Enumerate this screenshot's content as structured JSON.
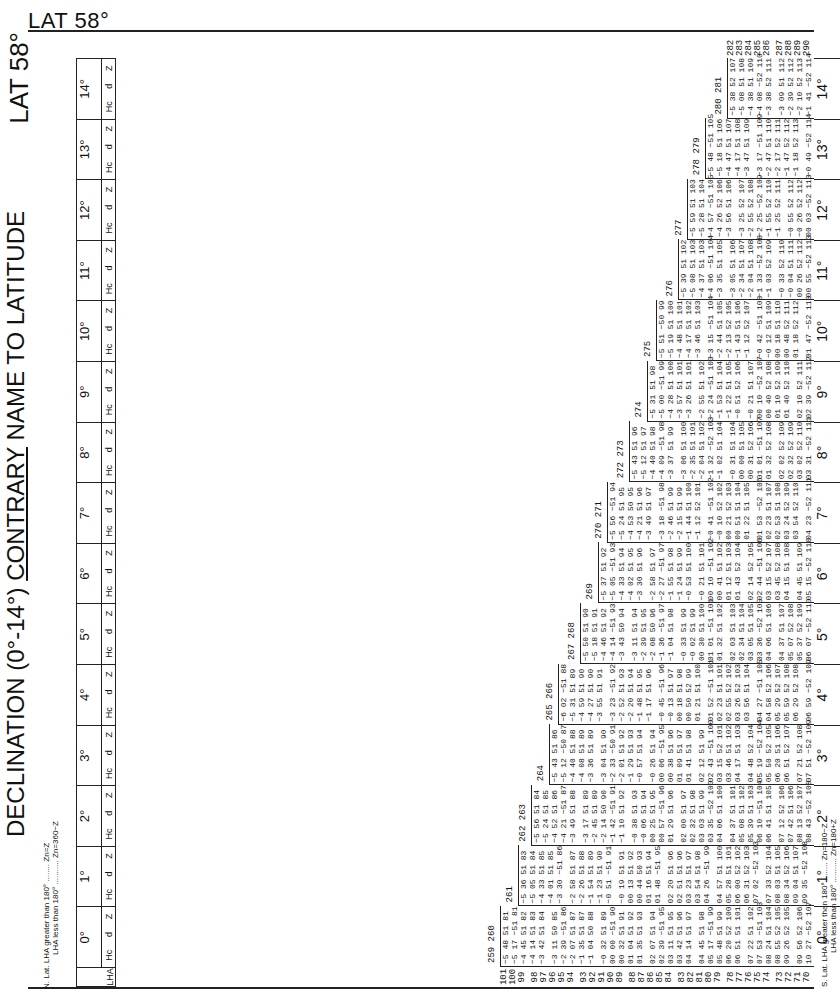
{
  "page": {
    "title_top": "LAT 58°",
    "title_side": "LAT 58°",
    "heading": "DECLINATION (0°-14°)",
    "heading_suffix_underlined": "CONTRARY",
    "heading_suffix_rest": "NAME TO LATITUDE",
    "north_note": {
      "label": "N. Lat.",
      "line1": "LHA greater than 180° ........ Zn=Z",
      "line2": "LHA less than 180° ........... Zn=360−Z"
    },
    "south_note": {
      "label": "S. Lat.",
      "line1": "LHA greater than 180° ........ Zn=180−Z",
      "line2": "LHA less than 180° ........... Zn=180+Z"
    }
  },
  "columns": {
    "lha_header": "LHA",
    "sub_headers": [
      "Hc",
      "d",
      "Z"
    ],
    "sub_units": [
      "° ′",
      "′",
      "°"
    ],
    "declinations": [
      "0°",
      "1°",
      "2°",
      "3°",
      "4°",
      "5°",
      "6°",
      "7°",
      "8°",
      "9°",
      "10°",
      "11°",
      "12°",
      "13°",
      "14°"
    ]
  },
  "lha_rows": {
    "left_side": [
      "101",
      "100",
      "99",
      "98",
      "97",
      "96",
      "95",
      "94",
      "93",
      "92",
      "91",
      "90",
      "89",
      "88",
      "87",
      "86",
      "85",
      "84",
      "83",
      "82",
      "81",
      "80",
      "79",
      "78",
      "77",
      "76",
      "75",
      "74",
      "73",
      "72",
      "71",
      "70"
    ]
  },
  "blocks": [
    {
      "decl": "0°",
      "edge": "259 260",
      "rows": [
        "−5 48 51 81",
        "−5 17 −51 81",
        "−4 45 51 82",
        "−4 14 51 83",
        "−3 42 51 84",
        "−3 11 50 85",
        "−2 39 −51 86",
        "−2 07 51 87",
        "−1 35 51 87",
        "−1 04 50 88",
        "−0 32 51 89",
        "00 00 −51 90",
        "00 32 51 91",
        "01 04 51 92",
        "01 35 51 93",
        "02 07 51 94",
        "02 39 −51 95",
        "03 11 51 95",
        "03 42 51 96",
        "04 14 51 97",
        "04 45 51 98",
        "05 17 −51 99",
        "05 48 51 99",
        "06 20 52 100",
        "06 51 51 101",
        "07 22 51 102",
        "07 53 −51 103",
        "08 24 51 104",
        "08 55 52 105",
        "09 26 52 105",
        "09 56 52 106",
        "10 27 −52 107"
      ]
    },
    {
      "decl": "1°",
      "edge": "261",
      "rows": [
        "−5 36 51 83",
        "−5 05 51 84",
        "−4 33 51 85",
        "−4 01 51 85",
        "−3 30 −51 86",
        "−2 58 51 87",
        "−2 26 51 88",
        "−1 54 51 89",
        "−1 23 51 90",
        "−0 51 −51 91",
        "−0 19 51 91",
        "00 13 51 92",
        "00 44 50 93",
        "01 16 51 94",
        "01 48 −51 95",
        "02 20 51 96",
        "02 51 51 96",
        "03 23 51 97",
        "03 54 51 98",
        "04 26 −51 99",
        "04 57 51 100",
        "05 28 51 101",
        "06 00 52 102",
        "06 31 52 103",
        "07 02 −52 103",
        "07 33 52 104",
        "08 03 51 105",
        "08 34 52 106",
        "09 04 51 107",
        "09 35 −52 108"
      ]
    },
    {
      "decl": "2°",
      "edge": "262 263",
      "rows": [
        "−5 56 51 84",
        "−5 24 51 85",
        "−4 52 51 86",
        "−4 21 −51 87",
        "−3 49 51 88",
        "−3 17 51 89",
        "−2 45 51 89",
        "−2 14 50 90",
        "−1 42 −51 91",
        "−1 10 51 92",
        "−0 38 51 93",
        "−0 06 51 94",
        "00 25 51 95",
        "00 57 −51 96",
        "01 29 51 96",
        "02 00 51 97",
        "02 32 51 98",
        "03 03 51 99",
        "03 35 −52 100",
        "04 06 51 100",
        "04 37 51 101",
        "05 08 51 102",
        "05 39 51 103",
        "06 10 −51 104",
        "06 41 51 105",
        "07 12 52 106",
        "07 42 51 106",
        "08 13 52 107",
        "08 43 −52 108"
      ]
    },
    {
      "decl": "3°",
      "edge": "264",
      "rows": [
        "−5 43 51 86",
        "−5 12 −50 87",
        "−4 40 51 88",
        "−4 08 51 89",
        "−3 36 51 89",
        "−3 04 51 90",
        "−2 33 −50 91",
        "−2 01 51 92",
        "−1 29 51 93",
        "−0 57 51 94",
        "−0 26 51 94",
        "00 06 −51 95",
        "00 38 51 96",
        "01 09 51 97",
        "01 41 51 98",
        "02 12 51 99",
        "02 43 −51 100",
        "03 15 52 101",
        "03 46 51 102",
        "04 17 51 103",
        "04 48 52 104",
        "05 19 −52 104",
        "05 50 52 105",
        "06 20 51 106",
        "06 51 52 107",
        "07 21 52 108",
        "07 51 −52 109"
      ]
    },
    {
      "decl": "4°",
      "edge": "265 266",
      "rows": [
        "−6 02 −51 88",
        "−5 31 51 89",
        "−4 59 51 90",
        "−4 27 51 90",
        "−3 55 51 91",
        "−3 23 −51 92",
        "−2 52 51 93",
        "−2 20 51 94",
        "−1 48 51 95",
        "−1 17 51 96",
        "−0 45 −51 96",
        "−0 13 51 97",
        "00 18 51 98",
        "00 50 52 99",
        "01 21 51 100",
        "01 52 −51 101",
        "02 23 51 101",
        "02 55 52 102",
        "03 26 52 103",
        "03 56 51 104",
        "04 27 −51 105",
        "04 58 52 106",
        "05 29 52 107",
        "05 59 52 108",
        "06 29 52 108",
        "06 59 −52 109"
      ]
    },
    {
      "decl": "5°",
      "edge": "267 268",
      "rows": [
        "−5 50 51 90",
        "−5 18 51 91",
        "−4 46 51 92",
        "−4 14 −51 93",
        "−3 43 50 94",
        "−3 11 51 94",
        "−2 39 51 95",
        "−2 08 50 96",
        "−1 36 −51 97",
        "−1 04 51 98",
        "−0 33 51 99",
        "−0 02 51 99",
        "00 30 51 100",
        "01 01 −51 101",
        "01 32 51 102",
        "02 03 51 103",
        "02 34 51 104",
        "03 05 51 105",
        "03 36 −52 105",
        "04 06 51 106",
        "04 37 51 107",
        "05 07 52 108",
        "05 37 52 109",
        "06 07 −52 110"
      ]
    },
    {
      "decl": "6°",
      "edge": "269",
      "rows": [
        "−5 37 51 92",
        "−5 05 −51 93",
        "−4 33 51 94",
        "−4 02 51 95",
        "−3 30 51 96",
        "−2 58 51 97",
        "−2 27 −51 97",
        "−1 55 51 98",
        "−1 24 51 99",
        "−0 53 51 100",
        "−0 21 51 101",
        "00 10 −51 102",
        "00 41 51 102",
        "01 12 51 103",
        "01 43 52 104",
        "02 14 52 105",
        "02 44 −51 106",
        "03 15 52 107",
        "03 45 52 108",
        "04 15 51 108",
        "04 45 51 109",
        "05 15 −52 110"
      ]
    },
    {
      "decl": "7°",
      "edge": "270 271",
      "rows": [
        "−5 56 −51 94",
        "−5 24 51 95",
        "−4 53 50 95",
        "−4 21 51 96",
        "−3 49 51 97",
        "−3 18 −51 98",
        "−2 46 51 99",
        "−2 15 51 99",
        "−1 44 51 100",
        "−1 12 52 101",
        "−0 41 −51 102",
        "−0 10 52 102",
        "00 21 52 103",
        "00 51 51 104",
        "01 22 51 105",
        "01 53 −52 106",
        "02 23 51 107",
        "02 53 51 108",
        "03 24 52 109",
        "03 54 52 110",
        "04 23 −52 111"
      ]
    },
    {
      "decl": "8°",
      "edge": "272 273",
      "rows": [
        "−5 43 51 96",
        "−5 12 51 97",
        "−4 40 51 98",
        "−4 09 −51 98",
        "−3 37 51 99",
        "−3 06 51 100",
        "−2 35 51 101",
        "−2 04 51 102",
        "−1 32 −52 103",
        "−1 02 51 104",
        "−0 31 51 104",
        "00 00 51 105",
        "00 31 52 106",
        "01 01 −51 107",
        "01 32 52 108",
        "02 02 52 109",
        "02 32 52 109",
        "03 02 52 110",
        "03 31 −52 111"
      ]
    },
    {
      "decl": "9°",
      "edge": "274",
      "rows": [
        "−5 31 51 98",
        "−5 00 −51 99",
        "−4 28 51 100",
        "−3 57 51 101",
        "−3 26 51 101",
        "−2 55 51 102",
        "−2 24 −51 103",
        "−1 53 51 104",
        "−1 22 51 105",
        "−0 51 52 106",
        "−0 21 51 107",
        "00 10 −52 107",
        "00 40 52 108",
        "01 10 52 109",
        "01 40 52 110",
        "02 10 52 111",
        "02 39 −52 112"
      ]
    },
    {
      "decl": "10°",
      "edge": "275",
      "rows": [
        "−5 51 −50 99",
        "−5 19 51 100",
        "−4 48 51 101",
        "−4 17 51 102",
        "−3 46 51 103",
        "−3 15 −51 104",
        "−2 44 51 105",
        "−2 13 52 105",
        "−1 43 51 106",
        "−1 12 52 107",
        "−0 42 −51 108",
        "−0 12 51 109",
        "00 18 51 110",
        "00 48 52 111",
        "01 18 52 112",
        "01 47 −52 113"
      ]
    },
    {
      "decl": "11°",
      "edge": "276",
      "rows": [
        "−5 39 51 102",
        "−5 08 51 103",
        "−4 37 51 103",
        "−4 06 −51 104",
        "−3 35 51 105",
        "−3 05 51 106",
        "−2 34 51 107",
        "−2 04 51 108",
        "−1 33 −52 108",
        "−1 03 52 109",
        "−0 33 52 110",
        "−0 04 51 111",
        "00 26 52 112",
        "00 55 −52 113"
      ]
    },
    {
      "decl": "12°",
      "edge": "277",
      "rows": [
        "−5 59 51 103",
        "−5 28 51 104",
        "−4 57 −51 105",
        "−4 26 52 106",
        "−3 56 51 106",
        "−3 25 52 107",
        "−2 55 52 108",
        "−2 25 −52 109",
        "−1 55 52 110",
        "−1 25 52 111",
        "−0 55 52 112",
        "−0 26 52 112",
        "00 03 −52 113"
      ]
    },
    {
      "decl": "13°",
      "edge": "278 279",
      "rows": [
        "−5 48 −51 105",
        "−5 18 51 106",
        "−4 47 51 107",
        "−4 17 51 108",
        "−3 47 51 109",
        "−3 17 −51 109",
        "−2 47 51 110",
        "−2 17 52 111",
        "−1 47 52 112",
        "−1 18 52 113",
        "−0 49 −52 114"
      ]
    },
    {
      "decl": "14°",
      "edge": "280 281",
      "rows": [
        "−5 38 52 107",
        "−5 08 51 108",
        "−4 38 51 109",
        "−4 08 −52 110",
        "−3 38 52 111",
        "−3 09 51 112",
        "−2 39 52 112",
        "−2 10 52 113",
        "−1 41 −52 114"
      ]
    }
  ],
  "lha_rows_right": [
    "282",
    "283",
    "284",
    "285",
    "286",
    "287",
    "288",
    "289",
    "290"
  ]
}
